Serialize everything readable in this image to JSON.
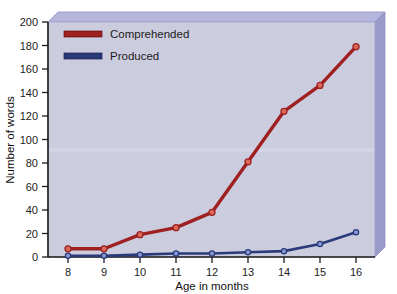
{
  "chart_data": {
    "type": "line",
    "title": "",
    "xlabel": "Age in months",
    "ylabel": "Number of words",
    "x": [
      8,
      9,
      10,
      11,
      12,
      13,
      14,
      15,
      16
    ],
    "xticklabels": [
      "8",
      "9",
      "10",
      "11",
      "12",
      "13",
      "14",
      "15",
      "16"
    ],
    "yticklabels": [
      "0",
      "20",
      "40",
      "60",
      "80",
      "100",
      "120",
      "140",
      "160",
      "180",
      "200"
    ],
    "yticks": [
      0,
      20,
      40,
      60,
      80,
      100,
      120,
      140,
      160,
      180,
      200
    ],
    "xlim": [
      8,
      16
    ],
    "ylim": [
      0,
      200
    ],
    "grid": false,
    "legend_position": "top-left-inside",
    "series": [
      {
        "name": "Comprehended",
        "color": "#9e2020",
        "values": [
          7,
          7,
          19,
          25,
          38,
          81,
          124,
          146,
          179
        ]
      },
      {
        "name": "Produced",
        "color": "#2a3a7a",
        "values": [
          1,
          1,
          2,
          3,
          3,
          4,
          5,
          11,
          21
        ]
      }
    ]
  },
  "style": {
    "plot_background": "#ccccdf",
    "bevel_top": "#b6b6dd",
    "bevel_side": "#9a9acb",
    "bevel_edge": "#8888bd",
    "axis_color": "#1b1b1b",
    "page_background": "#ffffff"
  },
  "legend": {
    "entries": [
      {
        "label": "Comprehended",
        "color": "#9e2020"
      },
      {
        "label": "Produced",
        "color": "#2a3a7a"
      }
    ]
  },
  "axes": {
    "y_title": "Number of words",
    "x_title": "Age in months"
  }
}
